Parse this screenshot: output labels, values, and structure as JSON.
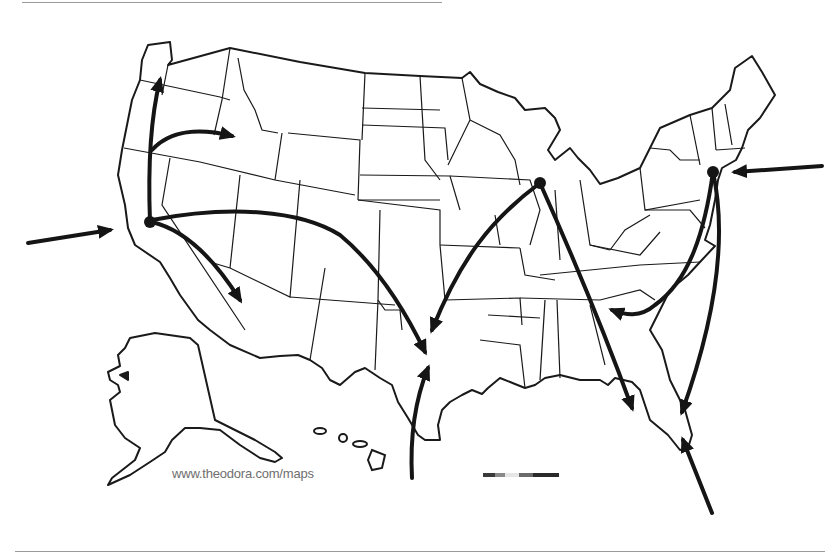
{
  "map": {
    "title": "United States migration flow map",
    "watermark": "www.theodora.com/maps",
    "colors": {
      "background": "#ffffff",
      "border": "#1a1a1a",
      "arrow": "#151515",
      "frame": "#9a9a9a",
      "watermark": "#6e6e6e"
    },
    "hubs": [
      {
        "name": "San Francisco",
        "x": 150,
        "y": 222
      },
      {
        "name": "Chicago",
        "x": 540,
        "y": 183
      },
      {
        "name": "New York",
        "x": 713,
        "y": 172
      }
    ],
    "flows": [
      {
        "from": "Pacific Ocean",
        "to": "San Francisco"
      },
      {
        "from": "San Francisco",
        "to": "Washington"
      },
      {
        "from": "San Francisco",
        "to": "Idaho"
      },
      {
        "from": "San Francisco",
        "to": "Arizona"
      },
      {
        "from": "San Francisco",
        "to": "Texas"
      },
      {
        "from": "Chicago",
        "to": "Texas"
      },
      {
        "from": "Chicago",
        "to": "Florida"
      },
      {
        "from": "Gulf of Mexico",
        "to": "Texas"
      },
      {
        "from": "Atlantic Ocean",
        "to": "New York"
      },
      {
        "from": "New York",
        "to": "Georgia"
      },
      {
        "from": "New York",
        "to": "Florida"
      },
      {
        "from": "Caribbean",
        "to": "Florida"
      }
    ],
    "scale_bar": {
      "segments": [
        "#3a3a3a",
        "#8a8a8a",
        "#e0e0e0",
        "#6a6a6a",
        "#2a2a2a"
      ]
    }
  }
}
